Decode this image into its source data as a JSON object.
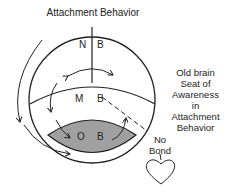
{
  "diagram": {
    "title": "Attachment Behavior",
    "regions": [
      {
        "id": "nb",
        "letters": [
          "N",
          "B"
        ]
      },
      {
        "id": "mb",
        "letters": [
          "M",
          "B"
        ]
      },
      {
        "id": "ob",
        "letters": [
          "O",
          "B"
        ],
        "fill": "#a0a0a0"
      }
    ],
    "side_label": [
      "Old brain",
      "Seat of",
      "Awareness",
      "in",
      "Attachment",
      "Behavior"
    ],
    "no_bond_label": [
      "No",
      "Bond"
    ],
    "heart_icon": "heart-outline",
    "colors": {
      "stroke": "#222222",
      "shade": "#a0a0a0",
      "background": "#ffffff"
    }
  }
}
